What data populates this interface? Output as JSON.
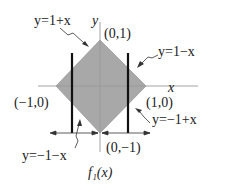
{
  "diagram": {
    "colors": {
      "region_fill": "#a8a8a8",
      "axis": "#999999",
      "line": "#111111",
      "text": "#222222"
    },
    "axes": {
      "x_label": "x",
      "y_label": "y"
    },
    "vertices": {
      "top": "(0,1)",
      "right": "(1,0)",
      "bottom": "(0,−1)",
      "left": "(−1,0)"
    },
    "edges": {
      "upper_left": "y=1+x",
      "upper_right": "y=1−x",
      "lower_right": "y=−1+x",
      "lower_left": "y=−1−x"
    },
    "function_label": "f₁(x)"
  }
}
